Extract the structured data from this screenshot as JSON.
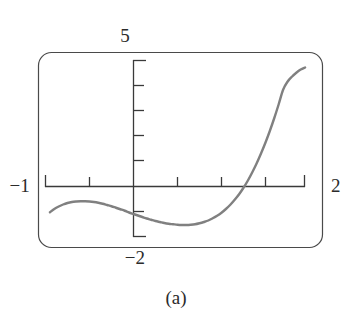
{
  "figure": {
    "caption": "(a)",
    "background_color": "#ffffff",
    "frame_color": "#4a4a4a",
    "axis_color": "#3a3a3a",
    "curve_color": "#808080",
    "label_color": "#2b2b2b"
  },
  "labels": {
    "y_max": "5",
    "y_min": "−2",
    "x_min": "−1",
    "x_max": "2"
  },
  "chart_data": {
    "type": "line",
    "title": "",
    "subtitle": "",
    "xlabel": "",
    "ylabel": "",
    "xlim": [
      -1,
      2
    ],
    "ylim": [
      -2,
      5
    ],
    "grid": false,
    "legend": "none",
    "window_labels": {
      "xmin": "−1",
      "xmax": "2",
      "ymin": "−2",
      "ymax": "5"
    },
    "x_tick_values": [
      -1.0,
      -0.5,
      0.5,
      1.0,
      1.5,
      2.0
    ],
    "y_tick_values": [
      5,
      4,
      3,
      2,
      1,
      -1,
      -2
    ],
    "tick_step_x": 0.5,
    "tick_step_y": 1,
    "annotations": [
      "local maximum near x = -0.55",
      "local minimum near x = 0.65",
      "x-intercept near x = 1.33",
      "curve exits top of window near x = 1.95"
    ],
    "series": [
      {
        "name": "f(x)",
        "x": [
          -0.95,
          -0.9,
          -0.85,
          -0.8,
          -0.75,
          -0.7,
          -0.65,
          -0.6,
          -0.55,
          -0.5,
          -0.45,
          -0.4,
          -0.35,
          -0.3,
          -0.25,
          -0.2,
          -0.15,
          -0.1,
          -0.05,
          0.0,
          0.05,
          0.1,
          0.15,
          0.2,
          0.25,
          0.3,
          0.35,
          0.4,
          0.45,
          0.5,
          0.55,
          0.6,
          0.65,
          0.7,
          0.75,
          0.8,
          0.85,
          0.9,
          0.95,
          1.0,
          1.05,
          1.1,
          1.15,
          1.2,
          1.25,
          1.3,
          1.35,
          1.4,
          1.45,
          1.5,
          1.55,
          1.6,
          1.65,
          1.7,
          1.75,
          1.8,
          1.85,
          1.9,
          1.95
        ],
        "y": [
          -1.03,
          -0.9,
          -0.8,
          -0.72,
          -0.66,
          -0.62,
          -0.6,
          -0.59,
          -0.59,
          -0.6,
          -0.62,
          -0.65,
          -0.69,
          -0.74,
          -0.79,
          -0.85,
          -0.91,
          -0.97,
          -1.04,
          -1.1,
          -1.16,
          -1.22,
          -1.28,
          -1.33,
          -1.38,
          -1.42,
          -1.46,
          -1.49,
          -1.51,
          -1.53,
          -1.54,
          -1.54,
          -1.53,
          -1.51,
          -1.47,
          -1.42,
          -1.36,
          -1.27,
          -1.17,
          -1.05,
          -0.9,
          -0.73,
          -0.53,
          -0.31,
          -0.05,
          0.24,
          0.57,
          0.93,
          1.33,
          1.76,
          2.23,
          2.74,
          3.29,
          3.87,
          4.19,
          4.39,
          4.55,
          4.68,
          4.76
        ]
      }
    ]
  }
}
